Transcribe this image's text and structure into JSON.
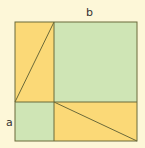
{
  "diagram": {
    "labels": {
      "a": "a",
      "b": "b"
    },
    "colors": {
      "background": "#fdf7d8",
      "yellow": "#fbd977",
      "green": "#cfe5b5",
      "stroke": "#6b6a3a"
    },
    "regions": [
      {
        "name": "top-left-rectangle",
        "fill": "yellow",
        "has_diagonal": true
      },
      {
        "name": "top-right-square-b",
        "fill": "green"
      },
      {
        "name": "bottom-left-square-a",
        "fill": "green"
      },
      {
        "name": "bottom-right-rectangle",
        "fill": "yellow",
        "has_diagonal": true
      }
    ]
  }
}
